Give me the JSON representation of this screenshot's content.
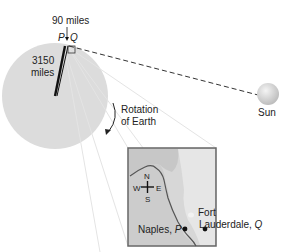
{
  "diagram": {
    "labels": {
      "distance_pq": "90 miles",
      "point_p": "P",
      "point_q": "Q",
      "radius_value": "3150",
      "radius_unit": "miles",
      "rotation_line1": "Rotation",
      "rotation_line2": "of Earth",
      "sun": "Sun"
    },
    "inset": {
      "compass": {
        "n": "N",
        "s": "S",
        "e": "E",
        "w": "W"
      },
      "city_p_name": "Naples,",
      "city_p_letter": "P",
      "city_q_line1": "Fort",
      "city_q_name": "Lauderdale,",
      "city_q_letter": "Q"
    },
    "colors": {
      "earth": "#dcdcdc",
      "land": "#d9d9d9",
      "water": "#c4c4c4",
      "ink": "#111111",
      "guide_lines": "#e2e2e2"
    }
  }
}
